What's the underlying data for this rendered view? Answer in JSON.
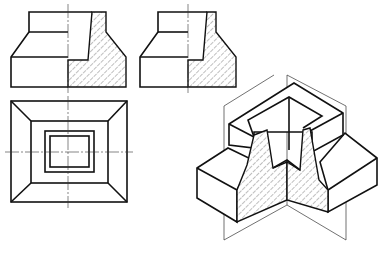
{
  "figure": {
    "type": "engineering-drawing",
    "views": [
      {
        "name": "front-view-half-section",
        "label": ""
      },
      {
        "name": "side-view-half-section",
        "label": ""
      },
      {
        "name": "top-view",
        "label": ""
      },
      {
        "name": "isometric-quarter-cutaway",
        "label": ""
      }
    ],
    "colors": {
      "line": "#111111",
      "thin_line": "#333333",
      "background": "#ffffff"
    }
  }
}
